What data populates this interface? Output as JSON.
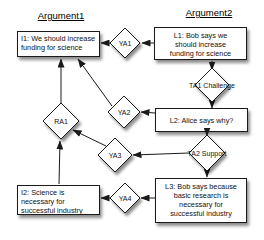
{
  "diagram": {
    "columns": {
      "argument1_title": "Argument1",
      "argument2_title": "Argument2"
    },
    "boxes": {
      "i1": {
        "lines": [
          "I1: We should increase",
          "funding for science"
        ]
      },
      "l1": {
        "lines": [
          "L1: Bob says we",
          "should increase",
          "funding for science"
        ]
      },
      "l2": {
        "lines": [
          "L2: Alice says why?"
        ]
      },
      "l3": {
        "lines": [
          "L3: Bob says because",
          "basic research is",
          "necessary for",
          "successful industry"
        ]
      },
      "i2": {
        "lines": [
          "I2: Science is",
          "necessary for",
          "successful industry"
        ]
      }
    },
    "diamonds": {
      "ya1": {
        "label": "YA1"
      },
      "ya2": {
        "label": "YA2"
      },
      "ya3": {
        "label": "YA3"
      },
      "ya4": {
        "label": "YA4"
      },
      "ra1": {
        "label": "RA1"
      },
      "ta1": {
        "label": "TA1 Challenge"
      },
      "ta2": {
        "label": "TA2 Support"
      }
    },
    "colors": {
      "node_fill": "#ffffff",
      "node_stroke": "#1a1a1a",
      "edge": "#1a1a1a",
      "text": "#111111",
      "background": "#ffffff",
      "shadow": "rgba(0,0,0,0.45)"
    }
  }
}
